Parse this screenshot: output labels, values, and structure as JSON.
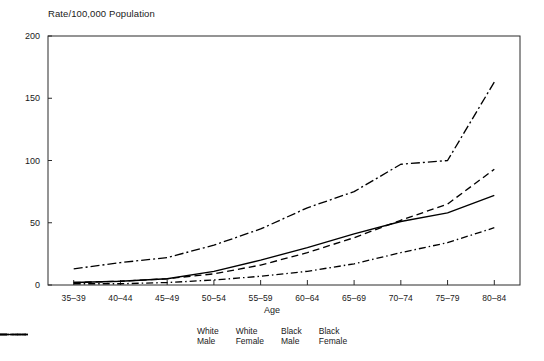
{
  "chart_data": {
    "type": "line",
    "title": "",
    "ylabel": "Rate/100,000 Population",
    "xlabel": "Age",
    "categories": [
      "35–39",
      "40–44",
      "45–49",
      "50–54",
      "55–59",
      "60–64",
      "65–69",
      "70–74",
      "75–79",
      "80–84"
    ],
    "yticks": [
      0,
      50,
      100,
      150,
      200
    ],
    "ylim": [
      0,
      200
    ],
    "grid": false,
    "legend_position": "bottom",
    "series": [
      {
        "name": "White Male",
        "label_line1": "White",
        "label_line2": "Male",
        "style": "dashed",
        "color": "#000000",
        "dasharray": "7,4",
        "values": [
          2,
          3,
          5,
          9,
          16,
          26,
          38,
          52,
          65,
          93
        ]
      },
      {
        "name": "White Female",
        "label_line1": "White",
        "label_line2": "Female",
        "style": "dash-dot",
        "color": "#000000",
        "dasharray": "7,3,1.5,3",
        "values": [
          1,
          1,
          2,
          4,
          7,
          11,
          17,
          26,
          34,
          46
        ]
      },
      {
        "name": "Black Male",
        "label_line1": "Black",
        "label_line2": "Male",
        "style": "dash-dot-long",
        "color": "#000000",
        "dasharray": "9,3,2,3",
        "values": [
          13,
          18,
          22,
          32,
          45,
          62,
          75,
          97,
          100,
          163
        ]
      },
      {
        "name": "Black Female",
        "label_line1": "Black",
        "label_line2": "Female",
        "style": "solid",
        "color": "#000000",
        "dasharray": "none",
        "values": [
          2,
          3,
          5,
          11,
          20,
          30,
          41,
          51,
          58,
          72
        ]
      }
    ]
  },
  "axis": {
    "y_title": "Rate/100,000 Population",
    "x_title": "Age",
    "y_tick_labels": [
      "200",
      "150",
      "100",
      "50",
      "0"
    ],
    "x_tick_labels": [
      "35–39",
      "40–44",
      "45–49",
      "50–54",
      "55–59",
      "60–64",
      "65–69",
      "70–74",
      "75–79",
      "80–84"
    ]
  },
  "legend": {
    "items": [
      {
        "line1": "White",
        "line2": "Male"
      },
      {
        "line1": "White",
        "line2": "Female"
      },
      {
        "line1": "Black",
        "line2": "Male"
      },
      {
        "line1": "Black",
        "line2": "Female"
      }
    ]
  }
}
